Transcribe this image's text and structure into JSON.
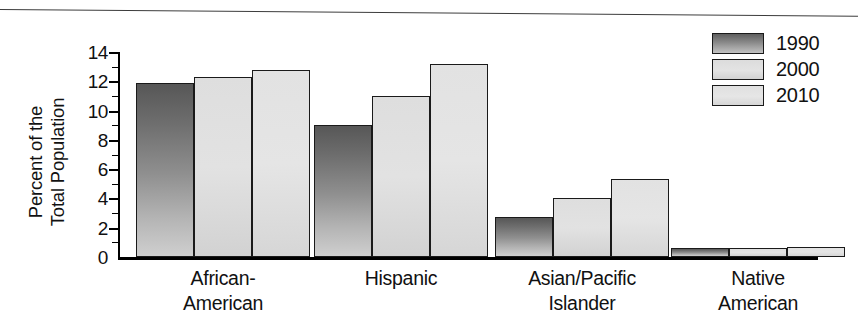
{
  "chart_data": {
    "type": "bar",
    "title": "",
    "subtitle": "",
    "xlabel": "",
    "ylabel": "Percent of the\nTotal Population",
    "categories": [
      "African-\nAmerican",
      "Hispanic",
      "Asian/Pacific\nIslander",
      "Native\nAmerican"
    ],
    "series": [
      {
        "name": "1990",
        "values": [
          11.9,
          9.0,
          2.7,
          0.6
        ],
        "color": "#6d6d6d"
      },
      {
        "name": "2000",
        "values": [
          12.3,
          11.0,
          4.0,
          0.6
        ],
        "color": "#dedede"
      },
      {
        "name": "2010",
        "values": [
          12.8,
          13.2,
          5.3,
          0.65
        ],
        "color": "#e3e3e3"
      }
    ],
    "ylim": [
      0,
      14
    ],
    "ytick_labels": [
      "0",
      "2",
      "4",
      "6",
      "8",
      "10",
      "12",
      "14"
    ],
    "ytick_values": [
      0,
      2,
      4,
      6,
      8,
      10,
      12,
      14
    ],
    "minor_ticks": [
      1,
      3,
      5,
      7,
      9,
      11,
      13
    ],
    "grid": false,
    "legend_position": "top-right",
    "orientation": "vertical",
    "grouped": true
  },
  "legend": {
    "entries": [
      {
        "label": "1990"
      },
      {
        "label": "2000"
      },
      {
        "label": "2010"
      }
    ]
  },
  "axes": {
    "y_title": "Percent of the\nTotal Population"
  }
}
